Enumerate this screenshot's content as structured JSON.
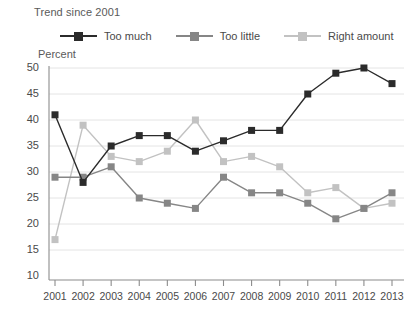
{
  "header": {
    "trend_label": "Trend since 2001",
    "percent_label": "Percent"
  },
  "legend": {
    "position": "top",
    "items": [
      {
        "label": "Too much",
        "color": "#2b2b2b",
        "marker": "square",
        "name": "legend-too-much"
      },
      {
        "label": "Too little",
        "color": "#868686",
        "marker": "square",
        "name": "legend-too-little"
      },
      {
        "label": "Right amount",
        "color": "#c2c2c2",
        "marker": "square",
        "name": "legend-right-amount"
      }
    ]
  },
  "chart_data": {
    "type": "line",
    "title": "",
    "subtitle": "Trend since 2001",
    "xlabel": "",
    "ylabel": "Percent",
    "ylim": [
      10,
      50
    ],
    "ytick_step": 5,
    "yticks": [
      10,
      15,
      20,
      25,
      30,
      35,
      40,
      45,
      50
    ],
    "grid": true,
    "legend_position": "top",
    "categories": [
      2001,
      2002,
      2003,
      2004,
      2005,
      2006,
      2007,
      2008,
      2009,
      2010,
      2011,
      2012,
      2013
    ],
    "xtick_labels": [
      "2001",
      "2002",
      "2003",
      "2004",
      "2005",
      "2006",
      "2007",
      "2008",
      "2009",
      "2010",
      "2011",
      "2012",
      "2013"
    ],
    "series": [
      {
        "name": "Too much",
        "color": "#2b2b2b",
        "values": [
          41,
          28,
          35,
          37,
          37,
          34,
          36,
          38,
          38,
          45,
          49,
          50,
          47
        ]
      },
      {
        "name": "Too little",
        "color": "#868686",
        "values": [
          29,
          29,
          31,
          25,
          24,
          23,
          29,
          26,
          26,
          24,
          21,
          23,
          26
        ]
      },
      {
        "name": "Right amount",
        "color": "#c2c2c2",
        "values": [
          17,
          39,
          33,
          32,
          34,
          40,
          32,
          33,
          31,
          26,
          27,
          23,
          24
        ]
      }
    ]
  }
}
